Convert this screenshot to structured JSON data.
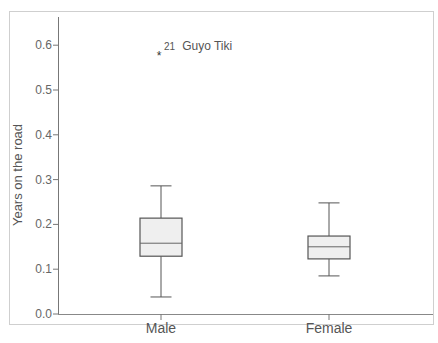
{
  "chart_data": {
    "type": "box",
    "title": "",
    "xlabel": "",
    "ylabel": "Years on the road",
    "ylim": [
      0.0,
      0.66
    ],
    "yticks": [
      "0.0",
      "0.1",
      "0.2",
      "0.3",
      "0.4",
      "0.5",
      "0.6"
    ],
    "categories": [
      "Male",
      "Female"
    ],
    "series": [
      {
        "name": "Male",
        "whisker_low": 0.038,
        "q1": 0.129,
        "median": 0.158,
        "q3": 0.214,
        "whisker_high": 0.286,
        "outliers": [
          {
            "value": 0.58,
            "marker": "*",
            "label": "21  Guyo Tiki",
            "case": "21",
            "name": "Guyo Tiki"
          }
        ]
      },
      {
        "name": "Female",
        "whisker_low": 0.085,
        "q1": 0.123,
        "median": 0.15,
        "q3": 0.174,
        "whisker_high": 0.248,
        "outliers": []
      }
    ],
    "grid": false,
    "legend": null
  },
  "axis": {
    "ylabel": "Years on the road",
    "tick_labels": [
      "0.0",
      "0.1",
      "0.2",
      "0.3",
      "0.4",
      "0.5",
      "0.6"
    ],
    "categories": [
      "Male",
      "Female"
    ]
  },
  "annotations": {
    "outlier_case": "21",
    "outlier_name": "Guyo Tiki"
  },
  "colors": {
    "box_fill": "#efefef",
    "box_stroke": "#555555",
    "axis": "#666666",
    "frame": "#cfcfcf"
  }
}
